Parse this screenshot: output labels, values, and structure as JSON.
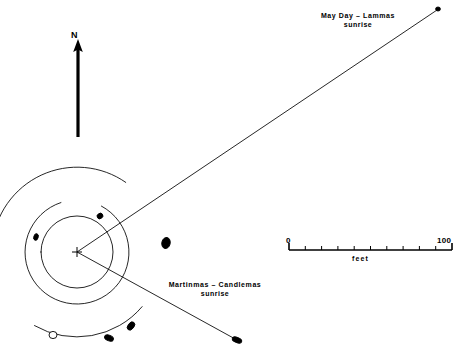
{
  "figure": {
    "type": "archaeoastronomical-site-plan",
    "background_color": "#ffffff",
    "ink_color": "#000000",
    "width": 464,
    "height": 352
  },
  "north_indicator": {
    "label": "N",
    "arrow_tip": [
      78,
      40
    ],
    "arrow_tail": [
      78,
      137
    ]
  },
  "scale_bar": {
    "min_label": "0",
    "max_label": "100",
    "units_label": "feet",
    "x_start": 289,
    "x_end": 452,
    "y": 250,
    "tick_count": 10
  },
  "alignments": [
    {
      "id": "may-day-lammas",
      "line1": "May Day  –  Lammas",
      "line2": "sunrise",
      "from": [
        77,
        252
      ],
      "to": [
        440,
        8
      ]
    },
    {
      "id": "martinmas-candlemas",
      "line1": "Martinmas  –  Candlemas",
      "line2": "sunrise",
      "from": [
        77,
        252
      ],
      "to": [
        237,
        340
      ]
    }
  ],
  "center_marker": {
    "name": "survey-station-cross",
    "x": 77,
    "y": 252,
    "arm": 5
  },
  "rings": [
    {
      "id": "inner-circle",
      "cx": 77,
      "cy": 252,
      "r": 36,
      "start_deg": 0,
      "end_deg": 360
    },
    {
      "id": "middle-ring",
      "cx": 77,
      "cy": 252,
      "r": 52,
      "start_deg": -62,
      "end_deg": 252
    },
    {
      "id": "outer-arc-upper",
      "cx": 77,
      "cy": 252,
      "r": 85,
      "start_deg": 185,
      "end_deg": 305
    },
    {
      "id": "outer-arc-lower",
      "cx": 77,
      "cy": 252,
      "r": 85,
      "start_deg": 40,
      "end_deg": 120
    }
  ],
  "stones": [
    {
      "id": "stone-inner-ne",
      "cx": 100,
      "cy": 216,
      "rx": 3.0,
      "ry": 2.6,
      "rot": -35,
      "filled": true
    },
    {
      "id": "stone-inner-w",
      "cx": 36,
      "cy": 237,
      "rx": 2.2,
      "ry": 3.4,
      "rot": 15,
      "filled": true
    },
    {
      "id": "stone-mid-e",
      "cx": 166,
      "cy": 243,
      "rx": 4.2,
      "ry": 5.6,
      "rot": 12,
      "filled": true
    },
    {
      "id": "stone-mid-sse",
      "cx": 131,
      "cy": 326,
      "rx": 3.0,
      "ry": 4.6,
      "rot": 38,
      "filled": true
    },
    {
      "id": "stone-mid-s",
      "cx": 109,
      "cy": 338,
      "rx": 4.6,
      "ry": 2.8,
      "rot": 22,
      "filled": true
    },
    {
      "id": "stone-outer-sw-open",
      "cx": 53,
      "cy": 335,
      "rx": 4.0,
      "ry": 3.6,
      "rot": 0,
      "filled": false
    },
    {
      "id": "stone-sightline-end-se",
      "cx": 237,
      "cy": 340,
      "rx": 5.0,
      "ry": 2.6,
      "rot": 22,
      "filled": true
    },
    {
      "id": "stone-sightline-end-ne",
      "cx": 438,
      "cy": 9,
      "rx": 2.4,
      "ry": 2.0,
      "rot": 0,
      "filled": true
    }
  ]
}
